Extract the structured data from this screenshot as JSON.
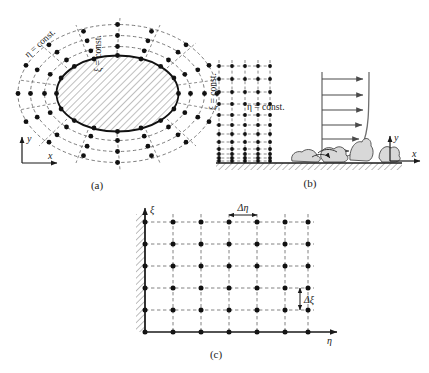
{
  "figure": {
    "panels": [
      {
        "id": "a",
        "caption": "(a)",
        "description": "O-type body-fitted grid around an elliptic body in physical space",
        "labels": {
          "eta_const": "η = const.",
          "xi_const": "ξ = const.",
          "axis_x": "x",
          "axis_y": "y"
        },
        "grid": {
          "type": "o-grid",
          "radial_rings": 4,
          "circumferential_lines": 16,
          "body": "hatched ellipse"
        }
      },
      {
        "id": "b",
        "caption": "(b)",
        "description": "Wall-clustered boundary layer grid with velocity profile over a rough wall",
        "labels": {
          "eta_const": "η = const.",
          "xi_const": "ξ = const.",
          "axis_x": "x",
          "axis_y": "y"
        },
        "grid": {
          "type": "stretched-cartesian",
          "columns": 5,
          "rows": 12,
          "clustering": "wall-normal"
        },
        "profile": {
          "arrows": 6,
          "shape": "boundary-layer"
        }
      },
      {
        "id": "c",
        "caption": "(c)",
        "description": "Uniform rectangular computational domain in transformed coordinates",
        "labels": {
          "delta_eta": "Δη",
          "delta_xi": "Δξ",
          "axis_eta": "η",
          "axis_xi": "ξ"
        },
        "grid": {
          "type": "uniform-cartesian",
          "columns": 7,
          "rows": 6,
          "spacing_uniform": true
        }
      }
    ],
    "colors": {
      "line": "#1a1a1a",
      "dash": "#555555",
      "node": "#111111",
      "hatch": "#777777",
      "profile": "#6f6f6f",
      "background": "#ffffff"
    }
  }
}
